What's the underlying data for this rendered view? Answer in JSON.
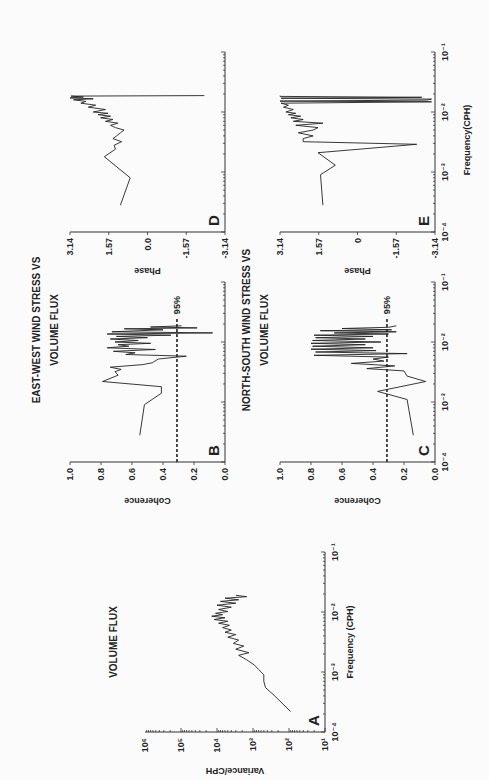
{
  "figure": {
    "section_titles": {
      "east_west_line1": "EAST-WEST WIND STRESS VS",
      "east_west_line2": "VOLUME FLUX",
      "north_south_line1": "NORTH-SOUTH WIND STRESS VS",
      "north_south_line2": "VOLUME FLUX"
    },
    "shared_xlabel": "Frequency(CPH)"
  },
  "chart_data": [
    {
      "id": "A",
      "type": "line",
      "panel_letter": "A",
      "title": "VOLUME FLUX",
      "xlabel": "Frequency (CPH)",
      "ylabel": "Variance/CPH",
      "xscale": "log",
      "yscale": "log",
      "xlim": [
        0.0001,
        0.1
      ],
      "ylim": [
        10,
        1000000
      ],
      "xticks": [
        "10^-4",
        "10^-3",
        "10^-2",
        "10^-1"
      ],
      "yticks": [
        "10^1",
        "10^2",
        "10^3",
        "10^4",
        "10^5",
        "10^6"
      ],
      "series": [
        {
          "name": "variance",
          "x": [
            0.00022,
            0.0004,
            0.00055,
            0.0007,
            0.0009,
            0.0011,
            0.0013,
            0.0016,
            0.0019,
            0.0021,
            0.0024,
            0.0027,
            0.003,
            0.0034,
            0.0038,
            0.0042,
            0.0046,
            0.005,
            0.0055,
            0.006,
            0.0065,
            0.007,
            0.0075,
            0.008,
            0.0085,
            0.009,
            0.0095,
            0.0102,
            0.011,
            0.012,
            0.013,
            0.014,
            0.015,
            0.016,
            0.017,
            0.018,
            0.019
          ],
          "y": [
            90,
            250,
            450,
            500,
            500,
            700,
            900,
            1500,
            2500,
            1300,
            3000,
            1800,
            3500,
            2500,
            5000,
            3000,
            6000,
            4000,
            7000,
            4500,
            9000,
            5000,
            12000,
            6000,
            14000,
            7000,
            11000,
            5000,
            9000,
            4000,
            10000,
            3000,
            8000,
            2500,
            6000,
            1500,
            3000
          ]
        }
      ]
    },
    {
      "id": "B",
      "type": "line",
      "panel_letter": "B",
      "ylabel": "Coherence",
      "xscale": "log",
      "xlim": [
        0.0001,
        0.1
      ],
      "ylim": [
        0.0,
        1.0
      ],
      "yticks": [
        "0.0",
        "0.2",
        "0.4",
        "0.6",
        "0.8",
        "1.0"
      ],
      "significance": {
        "label": "95%",
        "value": 0.31,
        "x_end": 0.025
      },
      "series": [
        {
          "name": "coherence",
          "x": [
            0.00028,
            0.0009,
            0.0014,
            0.0018,
            0.0022,
            0.0028,
            0.0032,
            0.0035,
            0.0038,
            0.0042,
            0.0045,
            0.0052,
            0.0058,
            0.0062,
            0.0066,
            0.007,
            0.0075,
            0.008,
            0.0085,
            0.009,
            0.0095,
            0.01,
            0.0106,
            0.0112,
            0.0118,
            0.0124,
            0.013,
            0.0136,
            0.0142,
            0.0148,
            0.0154,
            0.016,
            0.0166,
            0.0172,
            0.0178,
            0.0186
          ],
          "y": [
            0.55,
            0.52,
            0.41,
            0.41,
            0.79,
            0.69,
            0.71,
            0.67,
            0.74,
            0.53,
            0.47,
            0.43,
            0.25,
            0.64,
            0.58,
            0.72,
            0.45,
            0.76,
            0.62,
            0.69,
            0.48,
            0.71,
            0.56,
            0.74,
            0.5,
            0.7,
            0.35,
            0.76,
            0.08,
            0.73,
            0.55,
            0.4,
            0.65,
            0.18,
            0.48,
            0.28
          ]
        }
      ]
    },
    {
      "id": "C",
      "type": "line",
      "panel_letter": "C",
      "ylabel": "Coherence",
      "xlabel": "Frequency(CPH)",
      "xscale": "log",
      "xlim": [
        0.0001,
        0.1
      ],
      "ylim": [
        0.0,
        1.0
      ],
      "xticks": [
        "10^-4",
        "10^-3",
        "10^-2",
        "10^-1"
      ],
      "yticks": [
        "0.0",
        "0.2",
        "0.4",
        "0.6",
        "0.8",
        "1.0"
      ],
      "significance": {
        "label": "95%",
        "value": 0.31,
        "x_end": 0.025
      },
      "series": [
        {
          "name": "coherence",
          "x": [
            0.00028,
            0.0011,
            0.0015,
            0.0022,
            0.0027,
            0.0033,
            0.0036,
            0.004,
            0.0044,
            0.0048,
            0.0052,
            0.0056,
            0.006,
            0.0064,
            0.0068,
            0.0072,
            0.0076,
            0.008,
            0.0085,
            0.009,
            0.0095,
            0.01,
            0.0106,
            0.0112,
            0.0118,
            0.0124,
            0.013,
            0.0136,
            0.0142,
            0.0148,
            0.0154,
            0.016,
            0.0168,
            0.0176,
            0.0186
          ],
          "y": [
            0.14,
            0.18,
            0.37,
            0.06,
            0.18,
            0.2,
            0.44,
            0.26,
            0.54,
            0.33,
            0.4,
            0.3,
            0.78,
            0.18,
            0.77,
            0.38,
            0.8,
            0.4,
            0.79,
            0.45,
            0.8,
            0.35,
            0.79,
            0.45,
            0.77,
            0.4,
            0.78,
            0.3,
            0.65,
            0.25,
            0.74,
            0.28,
            0.6,
            0.3,
            0.25
          ]
        }
      ]
    },
    {
      "id": "D",
      "type": "line",
      "panel_letter": "D",
      "ylabel": "Phase",
      "xscale": "log",
      "xlim": [
        0.0001,
        0.1
      ],
      "ylim": [
        -3.14,
        3.14
      ],
      "yticks": [
        "-3.14",
        "-1.57",
        "0.0",
        "1.57",
        "3.14"
      ],
      "series": [
        {
          "name": "phase",
          "x": [
            0.00028,
            0.0008,
            0.0018,
            0.0024,
            0.0028,
            0.0032,
            0.0036,
            0.004,
            0.0045,
            0.005,
            0.0055,
            0.006,
            0.0065,
            0.007,
            0.0075,
            0.008,
            0.0085,
            0.009,
            0.0095,
            0.01,
            0.011,
            0.012,
            0.013,
            0.014,
            0.015,
            0.016,
            0.0166,
            0.0172,
            0.0178,
            0.0184,
            0.0188
          ],
          "y": [
            1.1,
            0.7,
            1.75,
            1.3,
            1.35,
            1.05,
            1.4,
            1.25,
            1.1,
            0.95,
            1.3,
            1.5,
            1.2,
            1.7,
            1.4,
            1.9,
            1.5,
            2.0,
            1.6,
            2.2,
            1.7,
            2.4,
            2.1,
            2.7,
            2.5,
            3.0,
            2.2,
            3.14,
            2.6,
            3.1,
            -2.3
          ]
        }
      ]
    },
    {
      "id": "E",
      "type": "line",
      "panel_letter": "E",
      "ylabel": "Phase",
      "xlabel": "Frequency(CPH)",
      "xscale": "log",
      "xlim": [
        0.0001,
        0.1
      ],
      "ylim": [
        -3.14,
        3.14
      ],
      "xticks": [
        "10^-4",
        "10^-3",
        "10^-2",
        "10^-1"
      ],
      "yticks": [
        "-3.14",
        "-1.57",
        "0",
        "1.57",
        "3.14"
      ],
      "series": [
        {
          "name": "phase",
          "x": [
            0.00028,
            0.0009,
            0.0013,
            0.0021,
            0.0029,
            0.0032,
            0.0036,
            0.004,
            0.0045,
            0.005,
            0.0055,
            0.006,
            0.0065,
            0.007,
            0.0075,
            0.008,
            0.0085,
            0.009,
            0.0095,
            0.01,
            0.011,
            0.012,
            0.013,
            0.014,
            0.0148,
            0.0152,
            0.0158,
            0.0164,
            0.017,
            0.0176,
            0.0182,
            0.0188
          ],
          "y": [
            1.4,
            1.5,
            0.9,
            1.6,
            -2.4,
            2.2,
            2.2,
            1.8,
            2.4,
            1.8,
            1.6,
            2.5,
            1.4,
            2.6,
            2.2,
            2.7,
            2.3,
            2.8,
            2.5,
            2.9,
            2.6,
            3.0,
            2.8,
            3.1,
            -3.0,
            3.14,
            -2.8,
            -3.0,
            3.1,
            -2.6,
            3.14,
            3.14
          ]
        }
      ]
    }
  ]
}
